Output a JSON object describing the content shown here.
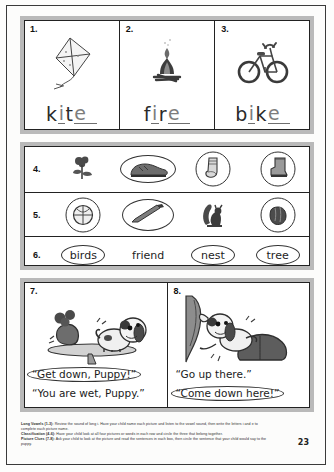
{
  "page": {
    "number": "23"
  },
  "sections": {
    "long_vowels": {
      "items": [
        {
          "num": "1.",
          "icon": "kite-illustration",
          "word": "kite",
          "printed": [
            "k",
            "t"
          ],
          "written": [
            "i",
            "e"
          ],
          "letters": [
            {
              "ch": "k",
              "mode": "print"
            },
            {
              "ch": "i",
              "mode": "write"
            },
            {
              "ch": "t",
              "mode": "print"
            },
            {
              "ch": "e",
              "mode": "write"
            }
          ]
        },
        {
          "num": "2.",
          "icon": "campfire-illustration",
          "word": "fire",
          "letters": [
            {
              "ch": "f",
              "mode": "print"
            },
            {
              "ch": "i",
              "mode": "write"
            },
            {
              "ch": "r",
              "mode": "print"
            },
            {
              "ch": "e",
              "mode": "write"
            }
          ]
        },
        {
          "num": "3.",
          "icon": "bicycle-illustration",
          "word": "bike",
          "letters": [
            {
              "ch": "b",
              "mode": "print"
            },
            {
              "ch": "i",
              "mode": "write"
            },
            {
              "ch": "k",
              "mode": "print"
            },
            {
              "ch": "e",
              "mode": "write"
            }
          ]
        }
      ]
    },
    "classification": {
      "rows": [
        {
          "num": "4.",
          "type": "pictures",
          "slots": [
            {
              "icon": "rose-illustration",
              "label": "rose",
              "circled": false,
              "shape": "none"
            },
            {
              "icon": "shoe-illustration",
              "label": "shoe",
              "circled": true,
              "shape": "cm-wide"
            },
            {
              "icon": "sock-illustration",
              "label": "sock",
              "circled": true,
              "shape": "cm-round"
            },
            {
              "icon": "boot-illustration",
              "label": "boot",
              "circled": true,
              "shape": "cm-round"
            }
          ]
        },
        {
          "num": "5.",
          "type": "pictures",
          "slots": [
            {
              "icon": "ball-illustration",
              "label": "ball",
              "circled": true,
              "shape": "cm-round"
            },
            {
              "icon": "bat-illustration",
              "label": "bat",
              "circled": true,
              "shape": "cm-oval"
            },
            {
              "icon": "squirrel-illustration",
              "label": "squirrel",
              "circled": false,
              "shape": "none"
            },
            {
              "icon": "glove-illustration",
              "label": "glove",
              "circled": true,
              "shape": "cm-round"
            }
          ]
        },
        {
          "num": "6.",
          "type": "words",
          "slots": [
            {
              "label": "birds",
              "circled": true,
              "shape": "cm-word"
            },
            {
              "label": "friend",
              "circled": false,
              "shape": "none"
            },
            {
              "label": "nest",
              "circled": true,
              "shape": "cm-word"
            },
            {
              "label": "tree",
              "circled": true,
              "shape": "cm-word"
            }
          ]
        }
      ]
    },
    "picture_clues": {
      "boxes": [
        {
          "num": "7.",
          "icon": "puppy-on-table-illustration",
          "sentences": [
            {
              "text": "“Get down, Puppy!”",
              "circled": true
            },
            {
              "text": "“You are wet, Puppy.”",
              "circled": false
            }
          ]
        },
        {
          "num": "8.",
          "icon": "puppy-climbing-curtain-illustration",
          "sentences": [
            {
              "text": "“Go up there.”",
              "circled": false
            },
            {
              "text": "“Come down here!”",
              "circled": true
            }
          ]
        }
      ]
    }
  },
  "footer": {
    "lines": [
      {
        "title": "Long Vowels (1-3):",
        "body": "Review the sound of long i. Have your child name each picture and listen to the vowel sound, then write the letters i and e to complete each picture name."
      },
      {
        "title": "Classification (4-6):",
        "body": "Have your child look at all four pictures or words in each row and circle the three that belong together."
      },
      {
        "title": "Picture Clues (7-8):",
        "body": "Ask your child to look at the picture and read the sentences in each box, then circle the sentence that your child would say to the puppy."
      }
    ]
  }
}
